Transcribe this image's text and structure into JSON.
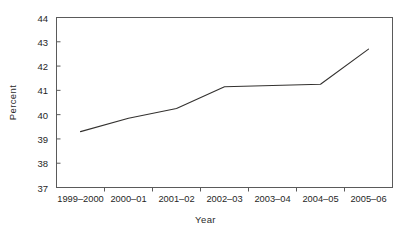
{
  "chart_data": {
    "type": "line",
    "title": "",
    "subtitle": "",
    "xlabel": "Year",
    "ylabel": "Percent",
    "categories": [
      "1999–2000",
      "2000–01",
      "2001–02",
      "2002–03",
      "2003–04",
      "2004–05",
      "2005–06"
    ],
    "values": [
      39.3,
      39.85,
      40.25,
      41.15,
      41.2,
      41.25,
      42.7
    ],
    "series": [
      {
        "name": "Percent",
        "values": [
          39.3,
          39.85,
          40.25,
          41.15,
          41.2,
          41.25,
          42.7
        ]
      }
    ],
    "ylim": [
      37,
      44
    ],
    "ytick_labels": [
      "37",
      "38",
      "39",
      "40",
      "41",
      "42",
      "43",
      "44"
    ],
    "ytick_values": [
      37,
      38,
      39,
      40,
      41,
      42,
      43,
      44
    ],
    "grid": false,
    "legend": false,
    "legend_position": "none",
    "markers": false,
    "line_color": "#33312f",
    "axis_color": "#5a5a5a",
    "background_color": "#ffffff"
  }
}
